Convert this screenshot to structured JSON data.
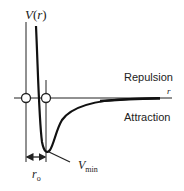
{
  "diagram": {
    "type": "potential-energy-curve",
    "y_axis_label": "V(r)",
    "y_axis_label_parts": {
      "main": "V",
      "paren_open": "(",
      "var": "r",
      "paren_close": ")"
    },
    "x_axis_label": "r",
    "region_labels": {
      "above": "Repulsion",
      "below": "Attraction"
    },
    "annotations": {
      "minimum": {
        "main": "V",
        "sub": "min"
      },
      "distance": {
        "main": "r",
        "sub": "o"
      }
    },
    "colors": {
      "curve": "#111111",
      "axes": "#222222",
      "marker_fill": "#ffffff",
      "text": "#222222"
    }
  }
}
